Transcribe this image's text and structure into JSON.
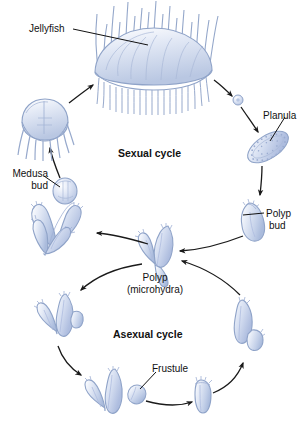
{
  "diagram": {
    "background_color": "#ffffff",
    "organism_fill": "#c9d4ea",
    "organism_fill_light": "#e8edf7",
    "organism_outline": "#8fa3c8",
    "arrow_color": "#1a1a1a",
    "label_color": "#111111"
  },
  "labels": {
    "jellyfish": "Jellyfish",
    "planula": "Planula",
    "medusa_bud_line1": "Medusa",
    "medusa_bud_line2": "bud",
    "polyp_bud_line1": "Polyp",
    "polyp_bud_line2": "bud",
    "sexual_cycle": "Sexual cycle",
    "asexual_cycle": "Asexual cycle",
    "polyp_line1": "Polyp",
    "polyp_line2": "(microhydra)",
    "frustule": "Frustule"
  },
  "cycles": [
    {
      "name": "Sexual cycle",
      "label": "Sexual cycle",
      "position": "upper",
      "stages": [
        {
          "id": "jellyfish",
          "label": "Jellyfish",
          "description": "mature medusa with bell and many tentacles"
        },
        {
          "id": "egg",
          "label": "",
          "description": "small round egg / zygote released from medusa"
        },
        {
          "id": "planula",
          "label": "Planula",
          "description": "ciliated oval swimming larva"
        },
        {
          "id": "polyp-bud",
          "label": "Polyp bud",
          "description": "young polyp developing from planula"
        },
        {
          "id": "branched-polyp-medusa",
          "label": "",
          "description": "branched polyp colony bearing a medusa bud"
        },
        {
          "id": "medusa-bud",
          "label": "Medusa bud",
          "description": "medusa bud on polyp colony"
        },
        {
          "id": "young-medusa",
          "label": "",
          "description": "newly released young medusa with tentacles"
        }
      ]
    },
    {
      "name": "Asexual cycle",
      "label": "Asexual cycle",
      "position": "lower",
      "stages": [
        {
          "id": "polyp-microhydra",
          "label": "Polyp (microhydra)",
          "description": "central branched Y-shaped polyp"
        },
        {
          "id": "polyp-lateral-bud-left",
          "label": "",
          "description": "polyp with lateral bud, left side"
        },
        {
          "id": "polyp-frustule-release",
          "label": "",
          "description": "polyp releasing a frustule"
        },
        {
          "id": "frustule",
          "label": "Frustule",
          "description": "small spindle-shaped creeping larva"
        },
        {
          "id": "simple-polyp",
          "label": "",
          "description": "simple unbranched settled polyp"
        },
        {
          "id": "polyp-lateral-bud-right",
          "label": "",
          "description": "polyp with side bud, right side"
        }
      ]
    }
  ],
  "annotation_lines": [
    {
      "from": "jellyfish-label",
      "to": "jellyfish-bell"
    },
    {
      "from": "planula-label",
      "to": "planula-body"
    },
    {
      "from": "medusa-bud-label",
      "to": "medusa-bud-body"
    },
    {
      "from": "polyp-bud-label",
      "to": "polyp-bud-body"
    },
    {
      "from": "frustule-label",
      "to": "frustule-body"
    }
  ]
}
